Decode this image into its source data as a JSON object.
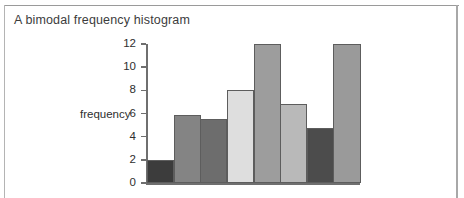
{
  "figure": {
    "title": "A bimodal frequency histogram",
    "frame_color": "#a8a8a8"
  },
  "chart_data": {
    "type": "bar",
    "title": "A bimodal frequency histogram",
    "xlabel": "",
    "ylabel": "frequency",
    "ylim": [
      0,
      12
    ],
    "ytick_labels": [
      "12",
      "10",
      "8",
      "6",
      "4",
      "2",
      "0"
    ],
    "yticks": [
      12,
      10,
      8,
      6,
      4,
      2,
      0
    ],
    "grid": false,
    "legend": "none",
    "categories": [
      "1",
      "2",
      "3",
      "4",
      "5",
      "6",
      "7",
      "8"
    ],
    "values": [
      2,
      5.9,
      5.5,
      8,
      12,
      6.8,
      4.75,
      12
    ],
    "bar_colors": [
      "#3c3c3c",
      "#848484",
      "#6d6d6d",
      "#dedede",
      "#9d9d9d",
      "#b9b9b9",
      "#4c4c4c",
      "#9a9a9a"
    ],
    "bar_edge_color": "#5d5d5d",
    "axis_color": "#6f6f6f"
  }
}
